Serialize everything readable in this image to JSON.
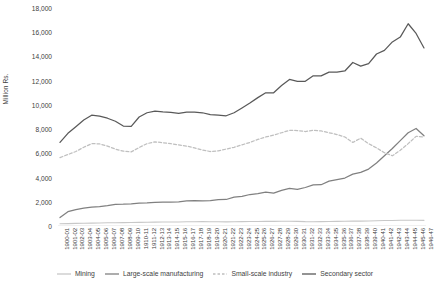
{
  "chart_data": {
    "type": "line",
    "title": "",
    "xlabel": "",
    "ylabel": "Million Rs.",
    "ylim": [
      0,
      18000
    ],
    "ytick_step": 2000,
    "grid": false,
    "legend_position": "bottom",
    "ytick_labels": [
      "18,000",
      "16,000",
      "14,000",
      "12,000",
      "10,000",
      "8,000",
      "6,000",
      "4,000",
      "2,000",
      "0"
    ],
    "ytick_values": [
      18000,
      16000,
      14000,
      12000,
      10000,
      8000,
      6000,
      4000,
      2000,
      0
    ],
    "categories": [
      "1900-01",
      "1901-02",
      "1902-03",
      "1903-04",
      "1904-05",
      "1905-06",
      "1906-07",
      "1907-08",
      "1908-09",
      "1909-10",
      "1910-11",
      "1911-12",
      "1912-13",
      "1913-14",
      "1914-15",
      "1915-16",
      "1916-17",
      "1917-18",
      "1918-19",
      "1919-20",
      "1920-21",
      "1921-22",
      "1922-23",
      "1923-24",
      "1924-25",
      "1925-26",
      "1926-27",
      "1927-28",
      "1928-29",
      "1929-30",
      "1930-31",
      "1931-32",
      "1932-33",
      "1933-34",
      "1934-35",
      "1935-36",
      "1936-37",
      "1937-38",
      "1938-39",
      "1939-40",
      "1940-41",
      "1941-42",
      "1942-43",
      "1943-44",
      "1944-45",
      "1945-46",
      "1946-47"
    ],
    "series": [
      {
        "name": "Mining",
        "color": "#c8c8c8",
        "style": "solid",
        "values": [
          190,
          200,
          215,
          225,
          240,
          250,
          265,
          270,
          280,
          290,
          300,
          310,
          320,
          325,
          330,
          335,
          345,
          355,
          360,
          350,
          345,
          340,
          350,
          360,
          370,
          375,
          380,
          385,
          390,
          395,
          380,
          360,
          355,
          365,
          375,
          385,
          395,
          405,
          400,
          410,
          430,
          450,
          460,
          470,
          480,
          470,
          465
        ]
      },
      {
        "name": "Large-scale manufacturing",
        "color": "#808080",
        "style": "solid",
        "values": [
          700,
          1180,
          1350,
          1470,
          1560,
          1600,
          1680,
          1790,
          1800,
          1830,
          1880,
          1900,
          1950,
          1980,
          1970,
          2000,
          2080,
          2090,
          2080,
          2090,
          2180,
          2190,
          2380,
          2450,
          2600,
          2680,
          2800,
          2720,
          2940,
          3100,
          3030,
          3180,
          3390,
          3410,
          3700,
          3830,
          3960,
          4280,
          4430,
          4700,
          5200,
          5800,
          6400,
          7050,
          7700,
          8050,
          7450
        ]
      },
      {
        "name": "Small-scale industry",
        "color": "#bfbfbf",
        "style": "dashed",
        "values": [
          5650,
          5900,
          6150,
          6500,
          6800,
          6780,
          6600,
          6350,
          6180,
          6120,
          6480,
          6800,
          6950,
          6880,
          6800,
          6700,
          6600,
          6450,
          6280,
          6150,
          6200,
          6350,
          6500,
          6700,
          6900,
          7150,
          7350,
          7500,
          7700,
          7900,
          7880,
          7800,
          7900,
          7850,
          7700,
          7550,
          7350,
          6900,
          7250,
          6800,
          6450,
          6050,
          5800,
          6250,
          6800,
          7400,
          7350
        ]
      },
      {
        "name": "Secondary sector",
        "color": "#595959",
        "style": "solid",
        "values": [
          6900,
          7650,
          8200,
          8750,
          9150,
          9080,
          8900,
          8650,
          8250,
          8230,
          9000,
          9350,
          9480,
          9420,
          9380,
          9300,
          9400,
          9400,
          9350,
          9200,
          9150,
          9100,
          9350,
          9750,
          10150,
          10600,
          11000,
          11000,
          11600,
          12100,
          11950,
          11950,
          12400,
          12400,
          12700,
          12700,
          12800,
          13500,
          13200,
          13400,
          14200,
          14500,
          15200,
          15600,
          16700,
          15900,
          14700
        ]
      }
    ]
  },
  "legend": {
    "items": [
      {
        "label": "Mining"
      },
      {
        "label": "Large-scale manufacturing"
      },
      {
        "label": "Small-scale industry"
      },
      {
        "label": "Secondary sector"
      }
    ]
  }
}
